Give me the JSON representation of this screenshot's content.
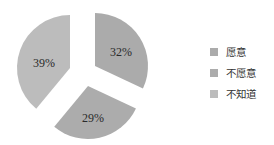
{
  "chart_data": {
    "type": "pie",
    "title": "",
    "categories": [
      "愿意",
      "不愿意",
      "不知道"
    ],
    "values": [
      32,
      29,
      39
    ],
    "labels": [
      "32%",
      "29%",
      "39%"
    ],
    "colors": [
      "#ababab",
      "#acacac",
      "#bcbcbc"
    ],
    "exploded": true,
    "legend_position": "right",
    "start_angle_deg": 0,
    "direction": "clockwise"
  },
  "legend": {
    "items": [
      {
        "label": "愿意",
        "color": "#ababab"
      },
      {
        "label": "不愿意",
        "color": "#acacac"
      },
      {
        "label": "不知道",
        "color": "#bcbcbc"
      }
    ]
  },
  "geometry": {
    "radius": 53,
    "slices": [
      {
        "apex_x": 95,
        "apex_y": 66,
        "label_x": 121,
        "label_y": 53
      },
      {
        "apex_x": 88,
        "apex_y": 86,
        "label_x": 93,
        "label_y": 119
      },
      {
        "apex_x": 70,
        "apex_y": 68,
        "label_x": 44,
        "label_y": 64
      }
    ]
  }
}
